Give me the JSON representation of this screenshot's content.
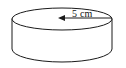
{
  "figure": {
    "kind": "geometry-diagram",
    "shape_name": "cylinder",
    "background_color": "#ffffff",
    "stroke_color": "#1a1a1a",
    "fill_color": "#ffffff",
    "annotations": {
      "radius_label": "5 cm",
      "radius_value": "5",
      "radius_unit": "cm"
    },
    "geometry": {
      "top_ellipse_center_x": 62,
      "top_ellipse_center_y": 19,
      "top_ellipse_rx": 50,
      "top_ellipse_ry": 11,
      "body_height": 30,
      "bottom_ellipse_center_y": 49,
      "dimension_line_start_x": 62,
      "dimension_line_end_x": 112,
      "dimension_line_y": 18,
      "arrow_direction": "left"
    }
  }
}
